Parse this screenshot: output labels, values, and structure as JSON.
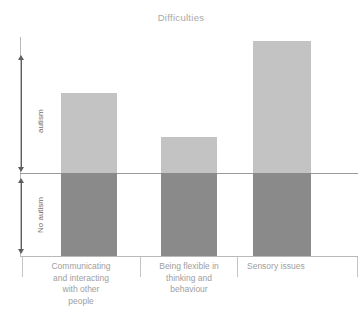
{
  "chart_data": {
    "type": "bar",
    "title": "Difficulties",
    "xlabel": "",
    "ylabel": "",
    "categories": [
      "Communicating and interacting with other people",
      "Being flexible in thinking and behaviour",
      "Sensory issues"
    ],
    "category_lines": [
      [
        "Communicating",
        "and interacting",
        "with other",
        "people"
      ],
      [
        "Being flexible in",
        "thinking and",
        "behaviour"
      ],
      [
        "Sensory issues"
      ]
    ],
    "bands": [
      {
        "name": "autism",
        "label": "autism",
        "color": "#c3c3c3"
      },
      {
        "name": "no-autism",
        "label": "No autism",
        "color": "#8a8a8a"
      }
    ],
    "series": [
      {
        "name": "No autism",
        "color": "#8a8a8a",
        "values": [
          83,
          83,
          83
        ]
      },
      {
        "name": "autism",
        "color": "#c3c3c3",
        "values": [
          80,
          36,
          132
        ]
      }
    ],
    "totals": [
      163,
      119,
      215
    ],
    "stacked": true,
    "grid": false,
    "legend": "none",
    "divider_label": "autism / No autism threshold",
    "axis_note": "Total bar height spans the No autism baseline band plus the additional autism band"
  },
  "title": {
    "text": "Difficulties"
  },
  "axis": {
    "autism_label": "autism",
    "no_autism_label": "No autism"
  },
  "colors": {
    "band_autism": "#c3c3c3",
    "band_no_autism": "#8a8a8a",
    "axis": "#b9b9b9",
    "divider": "#9b9b9b",
    "arrow": "#5e5e5e",
    "title_text": "#a8a8a8",
    "category_text": "#9e9e9e",
    "band_text": "#6d6d6d",
    "background": "#ffffff"
  }
}
